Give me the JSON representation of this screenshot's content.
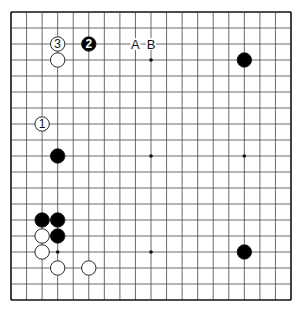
{
  "board": {
    "size": 19,
    "origin_x": 11,
    "origin_y": 12,
    "step_x": 15.556,
    "step_y": 16,
    "line_color": "#444444",
    "border_color": "#111111",
    "star_points": [
      [
        3,
        3
      ],
      [
        9,
        3
      ],
      [
        15,
        3
      ],
      [
        3,
        9
      ],
      [
        9,
        9
      ],
      [
        15,
        9
      ],
      [
        3,
        15
      ],
      [
        9,
        15
      ],
      [
        15,
        15
      ]
    ]
  },
  "stones": [
    {
      "color": "white",
      "col": 3,
      "row": 2,
      "label": "3"
    },
    {
      "color": "black",
      "col": 5,
      "row": 2,
      "label": "2"
    },
    {
      "color": "white",
      "col": 3,
      "row": 3,
      "label": ""
    },
    {
      "color": "white",
      "col": 2,
      "row": 7,
      "label": "1"
    },
    {
      "color": "black",
      "col": 3,
      "row": 9,
      "label": ""
    },
    {
      "color": "black",
      "col": 2,
      "row": 13,
      "label": ""
    },
    {
      "color": "black",
      "col": 3,
      "row": 13,
      "label": ""
    },
    {
      "color": "white",
      "col": 2,
      "row": 14,
      "label": ""
    },
    {
      "color": "black",
      "col": 3,
      "row": 14,
      "label": ""
    },
    {
      "color": "white",
      "col": 2,
      "row": 15,
      "label": ""
    },
    {
      "color": "white",
      "col": 3,
      "row": 16,
      "label": ""
    },
    {
      "color": "white",
      "col": 5,
      "row": 16,
      "label": ""
    },
    {
      "color": "black",
      "col": 15,
      "row": 3,
      "label": ""
    },
    {
      "color": "black",
      "col": 15,
      "row": 15,
      "label": ""
    }
  ],
  "markers": [
    {
      "col": 8,
      "row": 2,
      "label": "A"
    },
    {
      "col": 9,
      "row": 2,
      "label": "B"
    }
  ]
}
